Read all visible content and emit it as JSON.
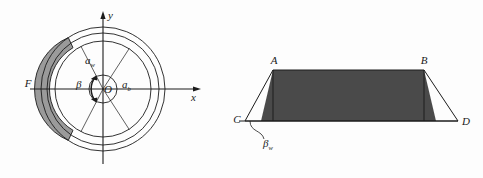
{
  "figure": {
    "background_color": "#fdfdfd",
    "line_color": "#1c1c1c",
    "band_fill_color": "#9a9a9a",
    "trapezoid_fill_color": "#4a4a4a"
  },
  "left_diagram": {
    "name": "annular-cross-section",
    "center_label": "O",
    "axis_x_label": "x",
    "axis_y_label": "y",
    "point_label_F": "F",
    "angle_alpha_w": "a",
    "angle_alpha_w_sub": "w",
    "angle_alpha_b": "a",
    "angle_alpha_b_sub": "b",
    "angle_beta": "β",
    "geometry": {
      "center_x": 103,
      "center_y": 89,
      "outer_radius": 62,
      "middle_radius": 56,
      "inner_ring_radius": 48,
      "hub_radius": 14,
      "band_start_deg": 124,
      "band_end_deg": 236
    }
  },
  "right_diagram": {
    "name": "developed-trapezoid",
    "point_label_A": "A",
    "point_label_B": "B",
    "point_label_C": "C",
    "point_label_D": "D",
    "angle_beta_w": "β",
    "angle_beta_w_sub": "w",
    "geometry": {
      "left_base_x": 245,
      "right_base_x": 458,
      "base_y": 121,
      "top_y": 70,
      "top_left_x": 273,
      "top_right_x": 424
    }
  }
}
